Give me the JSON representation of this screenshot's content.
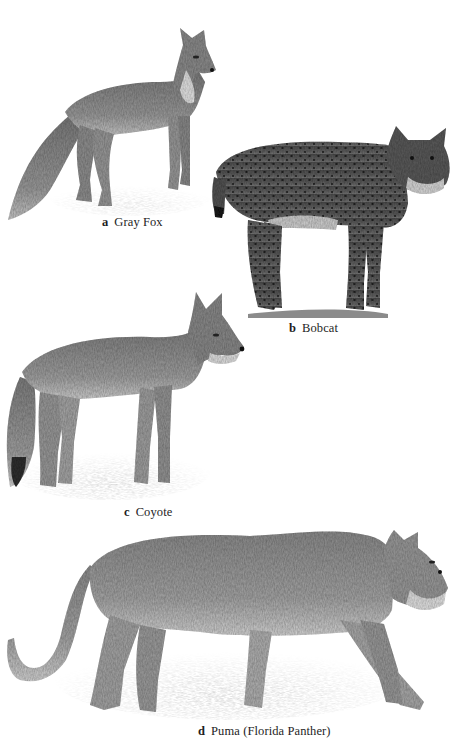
{
  "plate": {
    "background": "#ffffff",
    "style": "grayscale pencil illustration"
  },
  "figures": [
    {
      "letter": "a",
      "name": "Gray Fox",
      "tone": "#8a8a8a"
    },
    {
      "letter": "b",
      "name": "Bobcat",
      "tone": "#5e5e5e"
    },
    {
      "letter": "c",
      "name": "Coyote",
      "tone": "#8f8f8f"
    },
    {
      "letter": "d",
      "name": "Puma (Florida Panther)",
      "tone": "#9a9a9a"
    }
  ]
}
